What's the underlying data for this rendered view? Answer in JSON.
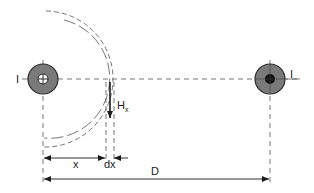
{
  "diagram": {
    "colors": {
      "conductor_fill": "#7a7a7a",
      "conductor_stroke": "#2a2a2a",
      "line": "#555555",
      "arrow": "#1a1a1a",
      "text": "#222222",
      "background": "#ffffff"
    },
    "conductors": [
      {
        "id": "left",
        "label": "I",
        "direction": "into-page",
        "symbol": "cross"
      },
      {
        "id": "right",
        "label": "I",
        "direction": "out-of-page",
        "symbol": "dot"
      }
    ],
    "labels": {
      "left_current": "I",
      "right_current": "I",
      "field": "H",
      "field_subscript": "x",
      "distance_x": "x",
      "element_dx": "dx",
      "separation": "D"
    }
  }
}
